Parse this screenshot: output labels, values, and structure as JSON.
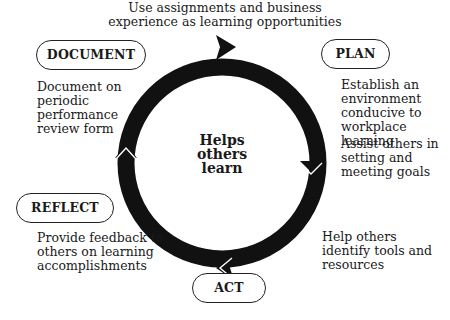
{
  "top_caption": {
    "line1": "Use assignments and business",
    "line2": "experience as learning opportunities"
  },
  "center": {
    "line1": "Helps",
    "line2": "others",
    "line3": "learn"
  },
  "stages": {
    "document": {
      "label": "DOCUMENT",
      "desc": [
        "Document on",
        "periodic",
        "performance",
        "review form"
      ]
    },
    "plan": {
      "label": "PLAN",
      "desc": [
        "Establish an",
        "environment",
        "conducive to",
        "workplace learning"
      ],
      "desc2": [
        "Assist others in",
        "setting and",
        "meeting goals"
      ]
    },
    "act": {
      "label": "ACT",
      "desc": [
        "Help others",
        "identify tools and",
        "resources"
      ]
    },
    "reflect": {
      "label": "REFLECT",
      "desc": [
        "Provide feedback to",
        "others on learning",
        "accomplishments"
      ]
    }
  },
  "colors": {
    "ring": "#111111",
    "text": "#1a1a1a",
    "background": "#ffffff"
  }
}
